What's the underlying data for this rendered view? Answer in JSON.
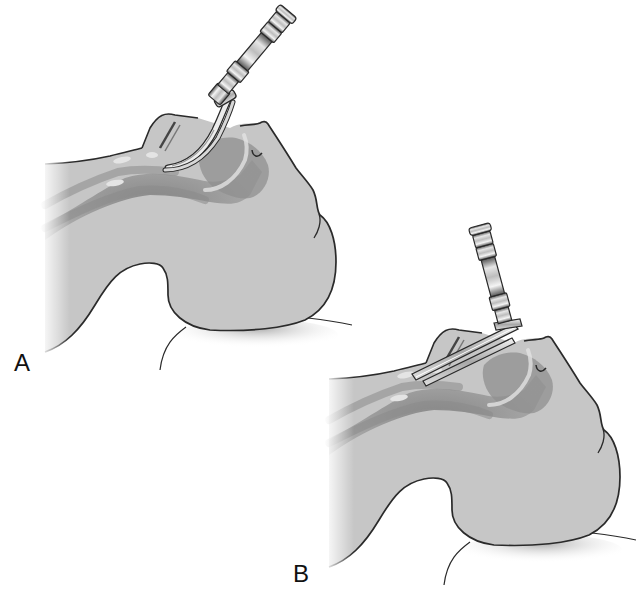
{
  "figure": {
    "panels": [
      {
        "label": "A",
        "instrument": "laryngoscope-curved-blade",
        "blade_type": "curved (Macintosh)"
      },
      {
        "label": "B",
        "instrument": "laryngoscope-straight-blade",
        "blade_type": "straight (Miller)"
      }
    ]
  },
  "colors": {
    "background": "#ffffff",
    "skin_fill": "#c8c8c8",
    "airway_dark": "#8c8c8c",
    "outline": "#2a2a2a",
    "metal_light": "#eeeeee",
    "metal_dark": "#6a6a6a"
  }
}
